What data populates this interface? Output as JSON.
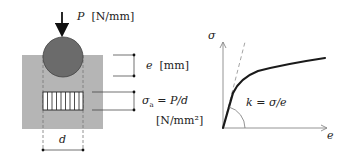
{
  "left_figure": {
    "load_symbol": "P",
    "load_unit": "[N/mm]",
    "indentation_symbol": "e",
    "indentation_unit": "[mm]",
    "stress_formula": "σa = P/d",
    "stress_symbol": "σ",
    "stress_subscript": "a",
    "stress_rhs": "= P/d",
    "stress_unit": "[N/mm²]",
    "width_symbol": "d",
    "colors": {
      "block": "#b5b5b5",
      "indenter": "#6b6b6b",
      "hatch_fill": "#ffffff"
    }
  },
  "right_figure": {
    "y_axis_label": "σ",
    "x_axis_label": "e",
    "slope_label": "k = σ/e",
    "colors": {
      "curve": "#1a1a1a",
      "axis": "#888888",
      "tangent": "#999999"
    }
  }
}
